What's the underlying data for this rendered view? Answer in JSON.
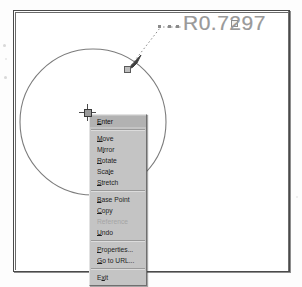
{
  "app": {
    "title": "CAD Drawing - Grip Edit Shortcut Menu",
    "frame_label": "drawing-frame"
  },
  "drawing": {
    "entity": "circle",
    "dimension_label": "R0.7297",
    "dimension_type": "radius",
    "leader_label": "radius-leader",
    "grip_on_circle_label": "circle-radius-grip",
    "grip_on_text_label": "dimension-text-grip",
    "arrowhead_label": "leader-arrowhead",
    "colors": {
      "line": "#7c7c7c",
      "dim_text": "#9a9a9a",
      "frame": "#4a4a4a",
      "grip_fill": "#bdbdbd",
      "menu_face": "#c4c4c4",
      "menu_highlight": "#b2b2b2",
      "menu_disabled_text": "#a4a4a4"
    },
    "circle": {
      "cx": 93,
      "cy": 122,
      "r": 73
    },
    "leader": {
      "start": [
        128,
        69
      ],
      "elbow": [
        162,
        27
      ],
      "end": [
        182,
        27
      ]
    }
  },
  "cursor": {
    "type": "crosshair-with-pickbox",
    "x": 87,
    "y": 112
  },
  "context_menu": {
    "name": "grip-shortcut-menu",
    "groups": [
      {
        "items": [
          {
            "label": "Enter",
            "mnemonic": "E",
            "enabled": true,
            "highlighted": true,
            "name": "menu-item-enter"
          }
        ]
      },
      {
        "items": [
          {
            "label": "Move",
            "mnemonic": "M",
            "enabled": true,
            "highlighted": false,
            "name": "menu-item-move"
          },
          {
            "label": "Mirror",
            "mnemonic": "I",
            "enabled": true,
            "highlighted": false,
            "name": "menu-item-mirror"
          },
          {
            "label": "Rotate",
            "mnemonic": "R",
            "enabled": true,
            "highlighted": false,
            "name": "menu-item-rotate"
          },
          {
            "label": "Scale",
            "mnemonic": "L",
            "enabled": true,
            "highlighted": false,
            "name": "menu-item-scale"
          },
          {
            "label": "Stretch",
            "mnemonic": "S",
            "enabled": true,
            "highlighted": false,
            "name": "menu-item-stretch"
          }
        ]
      },
      {
        "items": [
          {
            "label": "Base Point",
            "mnemonic": "B",
            "enabled": true,
            "highlighted": false,
            "name": "menu-item-base-point"
          },
          {
            "label": "Copy",
            "mnemonic": "C",
            "enabled": true,
            "highlighted": false,
            "name": "menu-item-copy"
          },
          {
            "label": "Reference",
            "mnemonic": "",
            "enabled": false,
            "highlighted": false,
            "name": "menu-item-reference"
          },
          {
            "label": "Undo",
            "mnemonic": "U",
            "enabled": true,
            "highlighted": false,
            "name": "menu-item-undo"
          }
        ]
      },
      {
        "items": [
          {
            "label": "Properties...",
            "mnemonic": "P",
            "enabled": true,
            "highlighted": false,
            "name": "menu-item-properties"
          },
          {
            "label": "Go to URL...",
            "mnemonic": "G",
            "enabled": true,
            "highlighted": false,
            "name": "menu-item-go-to-url"
          }
        ]
      },
      {
        "items": [
          {
            "label": "Exit",
            "mnemonic": "x",
            "enabled": true,
            "highlighted": false,
            "name": "menu-item-exit"
          }
        ]
      }
    ]
  }
}
